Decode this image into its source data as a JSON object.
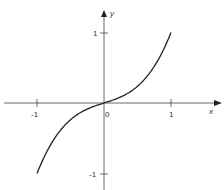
{
  "chart_data": {
    "type": "line",
    "title": "",
    "xlabel": "x",
    "ylabel": "y",
    "xlim": [
      -1.5,
      1.6
    ],
    "ylim": [
      -1.1,
      1.4
    ],
    "x_ticks": [
      "-1",
      "0",
      "1"
    ],
    "y_ticks": [
      "1",
      "-1"
    ],
    "origin_label": "0",
    "grid": false,
    "legend": null,
    "series": [
      {
        "name": "curve",
        "x": [
          -1,
          -0.75,
          -0.5,
          -0.25,
          0,
          0.25,
          0.5,
          0.75,
          1
        ],
        "y": [
          -1,
          -0.52,
          -0.24,
          -0.09,
          0,
          0.09,
          0.24,
          0.52,
          1
        ]
      }
    ]
  }
}
